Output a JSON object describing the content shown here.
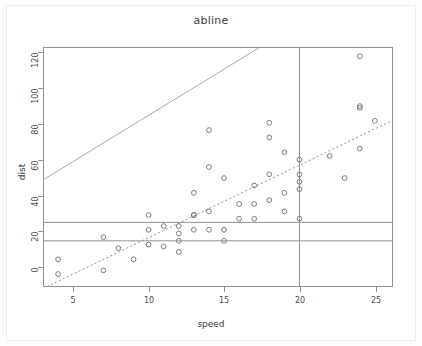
{
  "plot": {
    "title": "abline",
    "xlabel": "speed",
    "ylabel": "dist",
    "background": "#ffffff",
    "point_color": "#6d7274",
    "line_color": "#8e9293",
    "axis_color": "#8e9293"
  },
  "chart_data": {
    "type": "scatter",
    "title": "abline",
    "xlabel": "speed",
    "ylabel": "dist",
    "xlim": [
      3,
      26.2
    ],
    "ylim": [
      -5,
      125
    ],
    "xticks": [
      5,
      10,
      15,
      20,
      25
    ],
    "yticks": [
      0,
      20,
      40,
      60,
      80,
      100,
      120
    ],
    "grid": false,
    "legend": null,
    "x": [
      4,
      4,
      7,
      7,
      8,
      9,
      10,
      10,
      10,
      11,
      11,
      12,
      12,
      12,
      12,
      13,
      13,
      13,
      13,
      14,
      14,
      14,
      14,
      15,
      15,
      15,
      16,
      16,
      17,
      17,
      17,
      18,
      18,
      18,
      18,
      19,
      19,
      19,
      20,
      20,
      20,
      20,
      20,
      22,
      23,
      24,
      24,
      24,
      24,
      25
    ],
    "y": [
      2,
      10,
      4,
      22,
      16,
      10,
      18,
      26,
      34,
      17,
      28,
      14,
      20,
      24,
      28,
      26,
      34,
      34,
      46,
      26,
      36,
      60,
      80,
      20,
      26,
      54,
      32,
      40,
      32,
      40,
      50,
      42,
      56,
      76,
      84,
      36,
      46,
      68,
      32,
      48,
      52,
      56,
      64,
      66,
      54,
      70,
      92,
      93,
      120,
      85
    ],
    "series": [
      {
        "name": "cars",
        "marker": "open-circle",
        "color": "#6d7274"
      }
    ],
    "annotations": [
      {
        "kind": "hline",
        "value": 20,
        "style": "solid",
        "color": "#8e9293"
      },
      {
        "kind": "hline",
        "value": 30,
        "style": "solid",
        "color": "#8e9293"
      },
      {
        "kind": "vline",
        "value": 20,
        "style": "solid",
        "color": "#8e9293"
      },
      {
        "kind": "abline",
        "intercept": 38,
        "slope": 5,
        "style": "solid",
        "color": "#a6abac"
      },
      {
        "kind": "abline",
        "intercept": -17.58,
        "slope": 3.93,
        "style": "dotted",
        "color": "#8e9293"
      }
    ]
  },
  "axis": {
    "y_tick_labels": [
      "0",
      "20",
      "40",
      "60",
      "80",
      "100",
      "120"
    ],
    "x_tick_labels": [
      "5",
      "10",
      "15",
      "20",
      "25"
    ]
  }
}
